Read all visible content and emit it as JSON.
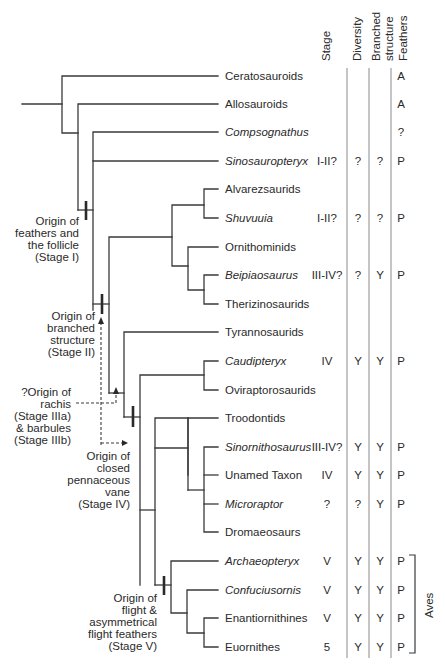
{
  "columns": {
    "stage": "Stage",
    "diversity": "Diversity",
    "branched_line1": "Branched",
    "branched_line2": "structure",
    "feathers": "Feathers"
  },
  "taxa": [
    {
      "name": "Ceratosauroids",
      "italic": false,
      "stage": "",
      "diversity": "",
      "branched": "",
      "feathers": "A"
    },
    {
      "name": "Allosauroids",
      "italic": false,
      "stage": "",
      "diversity": "",
      "branched": "",
      "feathers": "A"
    },
    {
      "name": "Compsognathus",
      "italic": true,
      "stage": "",
      "diversity": "",
      "branched": "",
      "feathers": "?"
    },
    {
      "name": "Sinosauropteryx",
      "italic": true,
      "stage": "I-II?",
      "diversity": "?",
      "branched": "?",
      "feathers": "P"
    },
    {
      "name": "Alvarezsaurids",
      "italic": false,
      "stage": "",
      "diversity": "",
      "branched": "",
      "feathers": ""
    },
    {
      "name": "Shuvuuia",
      "italic": true,
      "stage": "I-II?",
      "diversity": "?",
      "branched": "?",
      "feathers": "P"
    },
    {
      "name": "Ornithominids",
      "italic": false,
      "stage": "",
      "diversity": "",
      "branched": "",
      "feathers": ""
    },
    {
      "name": "Beipiaosaurus",
      "italic": true,
      "stage": "III-IV?",
      "diversity": "?",
      "branched": "Y",
      "feathers": "P"
    },
    {
      "name": "Therizinosaurids",
      "italic": false,
      "stage": "",
      "diversity": "",
      "branched": "",
      "feathers": ""
    },
    {
      "name": "Tyrannosaurids",
      "italic": false,
      "stage": "",
      "diversity": "",
      "branched": "",
      "feathers": ""
    },
    {
      "name": "Caudipteryx",
      "italic": true,
      "stage": "IV",
      "diversity": "Y",
      "branched": "Y",
      "feathers": "P"
    },
    {
      "name": "Oviraptorosaurids",
      "italic": false,
      "stage": "",
      "diversity": "",
      "branched": "",
      "feathers": ""
    },
    {
      "name": "Troodontids",
      "italic": false,
      "stage": "",
      "diversity": "",
      "branched": "",
      "feathers": ""
    },
    {
      "name": "Sinornithosaurus",
      "italic": true,
      "stage": "III-IV?",
      "diversity": "Y",
      "branched": "Y",
      "feathers": "P"
    },
    {
      "name": "Unamed Taxon",
      "italic": false,
      "stage": "IV",
      "diversity": "Y",
      "branched": "Y",
      "feathers": "P"
    },
    {
      "name": "Microraptor",
      "italic": true,
      "stage": "?",
      "diversity": "?",
      "branched": "Y",
      "feathers": "P"
    },
    {
      "name": "Dromaeosaurs",
      "italic": false,
      "stage": "",
      "diversity": "",
      "branched": "",
      "feathers": ""
    },
    {
      "name": "Archaeopteryx",
      "italic": true,
      "stage": "V",
      "diversity": "Y",
      "branched": "Y",
      "feathers": "P"
    },
    {
      "name": "Confuciusornis",
      "italic": true,
      "stage": "V",
      "diversity": "Y",
      "branched": "Y",
      "feathers": "P"
    },
    {
      "name": "Enantiornithines",
      "italic": false,
      "stage": "V",
      "diversity": "Y",
      "branched": "Y",
      "feathers": "P"
    },
    {
      "name": "Euornithes",
      "italic": false,
      "stage": "5",
      "diversity": "Y",
      "branched": "Y",
      "feathers": "P"
    }
  ],
  "annotations": {
    "stage1": [
      "Origin of",
      "feathers and",
      "the follicle",
      "(Stage I)"
    ],
    "stage2": [
      "Origin of",
      "branched",
      "structure",
      "(Stage II)"
    ],
    "stage3": [
      "?Origin of",
      "rachis",
      "(Stage IIIa)",
      "& barbules",
      "(Stage IIIb)"
    ],
    "stage4": [
      "Origin of",
      "closed",
      "pennaceous",
      "vane",
      "(Stage IV)"
    ],
    "stage5": [
      "Origin of",
      "flight &",
      "asymmetrical",
      "flight feathers",
      "(Stage V)"
    ]
  },
  "bracket_label": "Aves",
  "colors": {
    "line": "#3a3a3a",
    "text": "#2a2a2a",
    "divider": "#7a7a7a"
  }
}
